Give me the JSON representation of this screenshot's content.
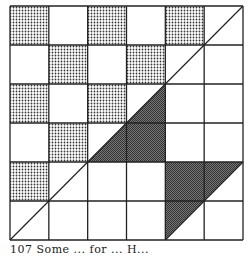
{
  "figure": {
    "rows": 6,
    "cols": 6,
    "origin": {
      "x": 10,
      "y": 6
    },
    "size": {
      "w": 233,
      "h": 234
    },
    "line_color": "#222222",
    "dot_color": "#333333",
    "dark_color": "#555555",
    "dotted_cells": [
      [
        0,
        0
      ],
      [
        0,
        2
      ],
      [
        0,
        4
      ],
      [
        1,
        1
      ],
      [
        1,
        3
      ],
      [
        2,
        0
      ],
      [
        2,
        2
      ],
      [
        3,
        1
      ],
      [
        4,
        0
      ]
    ],
    "dark_polygons": [
      [
        [
          2,
          4
        ],
        [
          4,
          2
        ],
        [
          4,
          4
        ]
      ],
      [
        [
          4,
          4
        ],
        [
          6,
          4
        ],
        [
          4,
          6
        ]
      ]
    ],
    "diagonals": [
      [
        [
          0,
          6
        ],
        [
          6,
          0
        ]
      ],
      [
        [
          4,
          6
        ],
        [
          6,
          4
        ]
      ]
    ]
  },
  "caption": {
    "text": "107  Some  ...  for  ...  H..."
  }
}
